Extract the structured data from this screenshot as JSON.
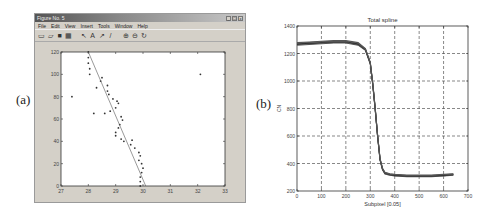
{
  "labels": {
    "a": "(a)",
    "b": "(b)"
  },
  "window": {
    "title": "Figure No. 5",
    "controls": [
      "_",
      "□",
      "x"
    ],
    "menu": [
      "File",
      "Edit",
      "View",
      "Insert",
      "Tools",
      "Window",
      "Help"
    ],
    "toolbar": [
      {
        "name": "new-icon",
        "glyph": "▭"
      },
      {
        "name": "open-icon",
        "glyph": "▱"
      },
      {
        "name": "save-icon",
        "glyph": "■"
      },
      {
        "name": "print-icon",
        "glyph": "▦"
      },
      {
        "name": "select-arrow-icon",
        "glyph": "↖"
      },
      {
        "name": "insert-text-icon",
        "glyph": "A"
      },
      {
        "name": "insert-arrow-icon",
        "glyph": "↗"
      },
      {
        "name": "insert-line-icon",
        "glyph": "/"
      },
      {
        "name": "zoom-in-icon",
        "glyph": "⊕"
      },
      {
        "name": "zoom-out-icon",
        "glyph": "⊖"
      },
      {
        "name": "rotate-icon",
        "glyph": "↻"
      }
    ]
  },
  "chart_data": [
    {
      "type": "scatter",
      "title": "",
      "xlabel": "",
      "ylabel": "",
      "xlim": [
        27,
        33
      ],
      "ylim": [
        0,
        120
      ],
      "xticks": [
        27,
        28,
        29,
        30,
        31,
        32,
        33
      ],
      "yticks": [
        0,
        20,
        40,
        60,
        80,
        100,
        120
      ],
      "grid": false,
      "series": [
        {
          "name": "edge points",
          "style": "markers",
          "points": [
            [
              28.0,
              120
            ],
            [
              28.0,
              115
            ],
            [
              28.0,
              110
            ],
            [
              28.05,
              105
            ],
            [
              28.05,
              100
            ],
            [
              28.5,
              97
            ],
            [
              28.45,
              94
            ],
            [
              28.7,
              90
            ],
            [
              28.3,
              88
            ],
            [
              28.7,
              85
            ],
            [
              28.75,
              82
            ],
            [
              28.9,
              78
            ],
            [
              29.05,
              76
            ],
            [
              29.1,
              74
            ],
            [
              29.0,
              70
            ],
            [
              28.8,
              67
            ],
            [
              28.6,
              65
            ],
            [
              29.2,
              62
            ],
            [
              29.25,
              59
            ],
            [
              29.15,
              55
            ],
            [
              29.1,
              52
            ],
            [
              29.0,
              48
            ],
            [
              29.0,
              45
            ],
            [
              29.2,
              42
            ],
            [
              29.3,
              40
            ],
            [
              29.55,
              37
            ],
            [
              29.7,
              34
            ],
            [
              29.85,
              30
            ],
            [
              29.9,
              27
            ],
            [
              29.85,
              23
            ],
            [
              29.95,
              20
            ],
            [
              30.0,
              16
            ],
            [
              29.95,
              12
            ],
            [
              29.9,
              8
            ],
            [
              29.9,
              4
            ],
            [
              29.9,
              0
            ],
            [
              27.4,
              80
            ],
            [
              32.1,
              100
            ],
            [
              28.2,
              65
            ],
            [
              29.6,
              41
            ]
          ]
        },
        {
          "name": "fitted line",
          "style": "line",
          "points": [
            [
              28.0,
              120
            ],
            [
              30.1,
              0
            ]
          ]
        }
      ]
    },
    {
      "type": "line",
      "title": "Total spline",
      "xlabel": "Subpixel [0.05]",
      "ylabel": "CN",
      "xlim": [
        0,
        700
      ],
      "ylim": [
        200,
        1400
      ],
      "xticks": [
        0,
        100,
        200,
        300,
        400,
        500,
        600,
        700
      ],
      "yticks": [
        200,
        400,
        600,
        800,
        1000,
        1200,
        1400
      ],
      "grid": true,
      "grid_style": "dashed",
      "series": [
        {
          "name": "overlaid profiles (bundle)",
          "x": [
            0,
            50,
            100,
            150,
            200,
            250,
            280,
            300,
            310,
            320,
            330,
            340,
            350,
            360,
            380,
            400,
            450,
            500,
            550,
            600,
            640
          ],
          "y": [
            1270,
            1275,
            1280,
            1285,
            1285,
            1270,
            1230,
            1130,
            980,
            800,
            600,
            430,
            360,
            330,
            320,
            315,
            310,
            310,
            310,
            315,
            320
          ]
        }
      ]
    }
  ]
}
